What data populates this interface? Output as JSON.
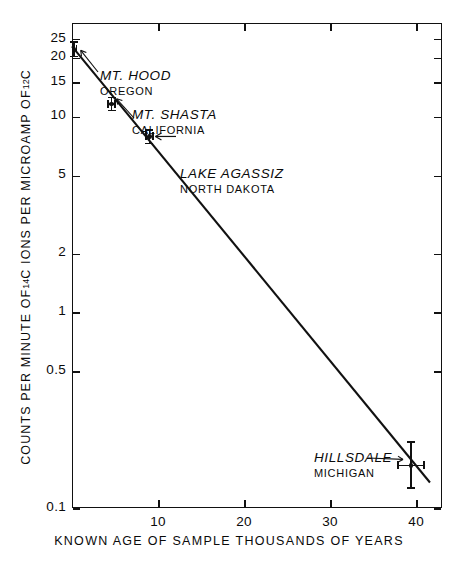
{
  "chart_data": {
    "type": "scatter",
    "title": "",
    "xlabel": "KNOWN AGE OF SAMPLE THOUSANDS OF YEARS",
    "ylabel_parts": {
      "a": "COUNTS PER MINUTE OF ",
      "sup1": "14",
      "b": "C IONS PER MICROAMP OF ",
      "sup2": "12",
      "c": "C"
    },
    "ylabel": "COUNTS PER MINUTE OF 14C IONS PER MICROAMP OF 12C",
    "yscale": "log",
    "ylim": [
      0.1,
      30
    ],
    "xlim": [
      0,
      43
    ],
    "grid": false,
    "legend": "none",
    "yticks": [
      {
        "value": 25,
        "label": "25"
      },
      {
        "value": 20,
        "label": "20"
      },
      {
        "value": 15,
        "label": "15"
      },
      {
        "value": 10,
        "label": "10"
      },
      {
        "value": 5,
        "label": "5"
      },
      {
        "value": 2,
        "label": "2"
      },
      {
        "value": 1,
        "label": "1"
      },
      {
        "value": 0.5,
        "label": "0.5"
      },
      {
        "value": 0.1,
        "label": "0.1"
      }
    ],
    "xticks": [
      {
        "value": 10,
        "label": "10"
      },
      {
        "value": 20,
        "label": "20"
      },
      {
        "value": 30,
        "label": "30"
      },
      {
        "value": 40,
        "label": "40"
      }
    ],
    "series": [
      {
        "name": "samples",
        "points": [
          {
            "name": "MT. HOOD",
            "sub": "OREGON",
            "x": 0.2,
            "y": 22.0,
            "yerr_low": 2.0,
            "yerr_high": 2.2,
            "xerr": 0.4
          },
          {
            "name": "MT. SHASTA",
            "sub": "CALIFORNIA",
            "x": 4.6,
            "y": 11.6,
            "yerr_low": 1.0,
            "yerr_high": 1.0,
            "xerr": 0.5
          },
          {
            "name": "LAKE AGASSIZ",
            "sub": "NORTH DAKOTA",
            "x": 9.0,
            "y": 7.9,
            "yerr_low": 0.7,
            "yerr_high": 0.7,
            "xerr": 0.5
          },
          {
            "name": "HILLSDALE",
            "sub": "MICHIGAN",
            "x": 39.4,
            "y": 0.165,
            "yerr_low": 0.04,
            "yerr_high": 0.055,
            "xerr": 1.6
          }
        ]
      }
    ],
    "fit_line": {
      "x0": 0.0,
      "y0": 22.8,
      "x1": 41.6,
      "y1": 0.135,
      "description": "radiocarbon decay best-fit line"
    },
    "annotations": [
      {
        "text": "MT. HOOD",
        "sub": "OREGON",
        "x_px": 100,
        "y_px": 66,
        "leader": true
      },
      {
        "text": "MT. SHASTA",
        "sub": "CALIFORNIA",
        "x_px": 132,
        "y_px": 105,
        "leader": true
      },
      {
        "text": "LAKE AGASSIZ",
        "sub": "NORTH DAKOTA",
        "x_px": 180,
        "y_px": 164,
        "leader": true
      },
      {
        "text": "HILLSDALE",
        "sub": "MICHIGAN",
        "x_px": 314,
        "y_px": 448,
        "leader": true
      }
    ]
  },
  "colors": {
    "ink": "#111111",
    "background": "#ffffff"
  }
}
